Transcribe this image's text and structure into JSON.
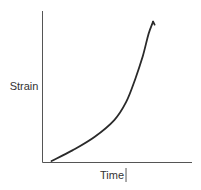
{
  "chart_data": {
    "type": "line",
    "title": "",
    "xlabel": "Time",
    "ylabel": "Strain",
    "xlim": [
      0,
      1
    ],
    "ylim": [
      0,
      1
    ],
    "grid": false,
    "legend": "none",
    "x_ticks": [],
    "y_ticks": [],
    "series": [
      {
        "name": "strain-vs-time",
        "x": [
          0.06,
          0.2,
          0.35,
          0.48,
          0.56,
          0.62,
          0.67,
          0.71,
          0.74
        ],
        "y": [
          0.01,
          0.08,
          0.17,
          0.28,
          0.4,
          0.55,
          0.7,
          0.85,
          0.93
        ]
      }
    ],
    "annotations": [
      {
        "type": "cursor-mark",
        "after": "xlabel"
      }
    ]
  }
}
